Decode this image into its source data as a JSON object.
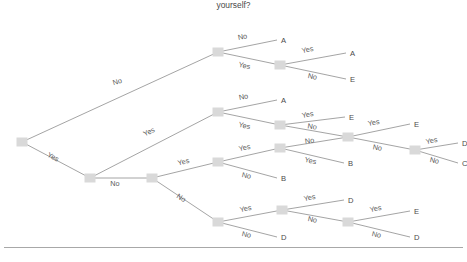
{
  "title": "yourself?",
  "colors": {
    "node_fill": "#d9d9d9",
    "edge_stroke": "#9a9a9a",
    "label_text": "#5a5a5a",
    "leaf_text": "#4a4a4a",
    "background": "#ffffff",
    "rule": "#a8a8a8"
  },
  "chart_data": {
    "type": "diagram",
    "diagram_type": "decision-tree",
    "title": "yourself?",
    "branch_labels": [
      "Yes",
      "No"
    ],
    "leaf_classes": [
      "A",
      "B",
      "C",
      "D",
      "E"
    ],
    "nodes": [
      {
        "id": "n0",
        "x": 22,
        "y": 142,
        "kind": "decision"
      },
      {
        "id": "n1",
        "x": 218,
        "y": 52,
        "kind": "decision"
      },
      {
        "id": "n2",
        "x": 280,
        "y": 65,
        "kind": "decision"
      },
      {
        "id": "n3",
        "x": 90,
        "y": 178,
        "kind": "decision"
      },
      {
        "id": "n4",
        "x": 218,
        "y": 112,
        "kind": "decision"
      },
      {
        "id": "n5",
        "x": 280,
        "y": 125,
        "kind": "decision"
      },
      {
        "id": "n6",
        "x": 348,
        "y": 137,
        "kind": "decision"
      },
      {
        "id": "n7",
        "x": 415,
        "y": 150,
        "kind": "decision"
      },
      {
        "id": "n8",
        "x": 152,
        "y": 178,
        "kind": "decision"
      },
      {
        "id": "n9",
        "x": 218,
        "y": 162,
        "kind": "decision"
      },
      {
        "id": "n10",
        "x": 280,
        "y": 148,
        "kind": "decision"
      },
      {
        "id": "n11",
        "x": 218,
        "y": 222,
        "kind": "decision"
      },
      {
        "id": "n12",
        "x": 282,
        "y": 210,
        "kind": "decision"
      },
      {
        "id": "n13",
        "x": 348,
        "y": 222,
        "kind": "decision"
      }
    ],
    "leaves": [
      {
        "id": "L1",
        "x": 277,
        "y": 40,
        "label": "A"
      },
      {
        "id": "L2",
        "x": 346,
        "y": 53,
        "label": "A"
      },
      {
        "id": "L3",
        "x": 346,
        "y": 79,
        "label": "E"
      },
      {
        "id": "L4",
        "x": 277,
        "y": 100,
        "label": "A"
      },
      {
        "id": "L5",
        "x": 345,
        "y": 117,
        "label": "E"
      },
      {
        "id": "L6",
        "x": 410,
        "y": 124,
        "label": "E"
      },
      {
        "id": "L7",
        "x": 458,
        "y": 143,
        "label": "D"
      },
      {
        "id": "L8",
        "x": 458,
        "y": 163,
        "label": "C"
      },
      {
        "id": "L9",
        "x": 277,
        "y": 178,
        "label": "B"
      },
      {
        "id": "L10",
        "x": 344,
        "y": 163,
        "label": "B"
      },
      {
        "id": "L11",
        "x": 344,
        "y": 200,
        "label": "D"
      },
      {
        "id": "L12",
        "x": 277,
        "y": 237,
        "label": "D"
      },
      {
        "id": "L13",
        "x": 410,
        "y": 211,
        "label": "E"
      },
      {
        "id": "L14",
        "x": 410,
        "y": 237,
        "label": "D"
      }
    ],
    "edges": [
      {
        "from": "n0",
        "to": "n1",
        "label": "No",
        "lx": 118,
        "ly": 84,
        "angle": -16
      },
      {
        "from": "n0",
        "to": "n3",
        "label": "Yes",
        "lx": 52,
        "ly": 159,
        "angle": 28
      },
      {
        "from": "n1",
        "to": "L1",
        "label": "No",
        "lx": 243,
        "ly": 39,
        "angle": -12
      },
      {
        "from": "n1",
        "to": "n2",
        "label": "Yes",
        "lx": 244,
        "ly": 68,
        "angle": 11
      },
      {
        "from": "n2",
        "to": "L2",
        "label": "Yes",
        "lx": 308,
        "ly": 52,
        "angle": -12
      },
      {
        "from": "n2",
        "to": "L3",
        "label": "No",
        "lx": 312,
        "ly": 79,
        "angle": 11
      },
      {
        "from": "n3",
        "to": "n4",
        "label": "Yes",
        "lx": 150,
        "ly": 134,
        "angle": -26
      },
      {
        "from": "n3",
        "to": "n8",
        "label": "No",
        "lx": 115,
        "ly": 186,
        "angle": 0
      },
      {
        "from": "n4",
        "to": "L4",
        "label": "No",
        "lx": 244,
        "ly": 99,
        "angle": -12
      },
      {
        "from": "n4",
        "to": "n5",
        "label": "Yes",
        "lx": 244,
        "ly": 128,
        "angle": 11
      },
      {
        "from": "n5",
        "to": "L5",
        "label": "Yes",
        "lx": 308,
        "ly": 117,
        "angle": -10
      },
      {
        "from": "n5",
        "to": "n6",
        "label": "No",
        "lx": 312,
        "ly": 129,
        "angle": 8
      },
      {
        "from": "n6",
        "to": "L6",
        "label": "Yes",
        "lx": 374,
        "ly": 125,
        "angle": -10
      },
      {
        "from": "n6",
        "to": "n7",
        "label": "No",
        "lx": 377,
        "ly": 150,
        "angle": 10
      },
      {
        "from": "n7",
        "to": "L7",
        "label": "Yes",
        "lx": 432,
        "ly": 143,
        "angle": -11
      },
      {
        "from": "n7",
        "to": "L8",
        "label": "No",
        "lx": 434,
        "ly": 163,
        "angle": 11
      },
      {
        "from": "n8",
        "to": "n9",
        "label": "Yes",
        "lx": 184,
        "ly": 164,
        "angle": -14
      },
      {
        "from": "n8",
        "to": "n11",
        "label": "No",
        "lx": 180,
        "ly": 200,
        "angle": 31
      },
      {
        "from": "n9",
        "to": "n10",
        "label": "Yes",
        "lx": 245,
        "ly": 150,
        "angle": -12
      },
      {
        "from": "n9",
        "to": "L9",
        "label": "No",
        "lx": 246,
        "ly": 178,
        "angle": 12
      },
      {
        "from": "n10",
        "to": "n6",
        "label": "No",
        "lx": 310,
        "ly": 143,
        "angle": -8
      },
      {
        "from": "n10",
        "to": "L10",
        "label": "Yes",
        "lx": 310,
        "ly": 163,
        "angle": 12
      },
      {
        "from": "n11",
        "to": "n12",
        "label": "Yes",
        "lx": 246,
        "ly": 211,
        "angle": -11
      },
      {
        "from": "n11",
        "to": "L12",
        "label": "No",
        "lx": 246,
        "ly": 237,
        "angle": 12
      },
      {
        "from": "n12",
        "to": "L11",
        "label": "Yes",
        "lx": 310,
        "ly": 200,
        "angle": -11
      },
      {
        "from": "n12",
        "to": "n13",
        "label": "No",
        "lx": 312,
        "ly": 222,
        "angle": 11
      },
      {
        "from": "n13",
        "to": "L13",
        "label": "Yes",
        "lx": 376,
        "ly": 211,
        "angle": -11
      },
      {
        "from": "n13",
        "to": "L14",
        "label": "No",
        "lx": 376,
        "ly": 237,
        "angle": 12
      }
    ]
  }
}
